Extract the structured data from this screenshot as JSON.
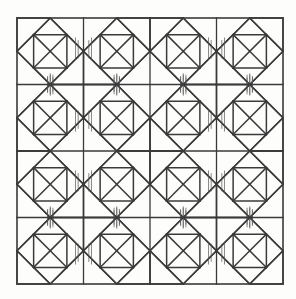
{
  "figure": {
    "name": "quilt-block-pattern",
    "canvas": {
      "width": 296,
      "height": 299
    },
    "background_color": "#fdfdfc"
  },
  "style": {
    "line_color": "#3a3a3a",
    "border_color": "#3a3a3a",
    "hairline_color": "#555555",
    "border_width": 1.6,
    "grid_width": 1.3,
    "block_width": 1.5,
    "hairline_width": 0.7,
    "fill": "none"
  },
  "grid": {
    "origin_x": 17,
    "origin_y": 18,
    "cell_size": 66.5,
    "columns": 4,
    "rows": 4,
    "total_width": 266,
    "total_height": 266,
    "column_line_x": [
      17,
      83.5,
      150,
      216.5,
      283
    ],
    "row_line_y": [
      18,
      84.5,
      151,
      217.5,
      284
    ]
  },
  "block": {
    "name": "diamond-card-trick",
    "description": "Square cell with inscribed diamond (square rotated 45 degrees) whose vertices touch the cell edge midpoints, plus internal diagonals subdividing the diamond into triangles and a small notched square.",
    "unit": 1.0,
    "diamond_vertices": [
      [
        0.5,
        0.0
      ],
      [
        1.0,
        0.5
      ],
      [
        0.5,
        1.0
      ],
      [
        0.0,
        0.5
      ]
    ],
    "internal_segments": [
      [
        0.0,
        0.5,
        0.5,
        0.0
      ],
      [
        0.5,
        0.0,
        1.0,
        0.5
      ],
      [
        1.0,
        0.5,
        0.5,
        1.0
      ],
      [
        0.5,
        1.0,
        0.0,
        0.5
      ],
      [
        0.25,
        0.25,
        0.75,
        0.75
      ],
      [
        0.5,
        0.0,
        0.25,
        0.25
      ],
      [
        0.25,
        0.25,
        0.0,
        0.5
      ],
      [
        0.75,
        0.75,
        1.0,
        0.5
      ],
      [
        0.75,
        0.75,
        0.5,
        1.0
      ],
      [
        0.25,
        0.25,
        0.75,
        0.25
      ],
      [
        0.75,
        0.25,
        0.75,
        0.75
      ],
      [
        0.25,
        0.25,
        0.25,
        0.75
      ],
      [
        0.25,
        0.75,
        0.75,
        0.75
      ],
      [
        0.5,
        0.0,
        0.75,
        0.25
      ],
      [
        0.25,
        0.75,
        0.5,
        1.0
      ],
      [
        0.0,
        0.5,
        0.25,
        0.75
      ],
      [
        0.75,
        0.25,
        1.0,
        0.5
      ],
      [
        0.5,
        0.5,
        0.75,
        0.25
      ],
      [
        0.5,
        0.5,
        0.25,
        0.75
      ]
    ],
    "corner_segments": [
      [
        0.0,
        0.0,
        0.0,
        0.5
      ],
      [
        0.0,
        0.0,
        0.5,
        0.0
      ],
      [
        1.0,
        1.0,
        1.0,
        0.5
      ],
      [
        1.0,
        1.0,
        0.5,
        1.0
      ]
    ],
    "hairlines": [
      [
        0.88,
        0.3,
        0.88,
        0.62
      ],
      [
        0.92,
        0.34,
        0.92,
        0.6
      ],
      [
        0.5,
        0.86,
        0.5,
        1.16
      ],
      [
        0.54,
        0.9,
        0.54,
        1.14
      ],
      [
        0.46,
        0.9,
        0.46,
        1.12
      ]
    ]
  },
  "tiling": {
    "description": "Blocks alternate mirrored horizontally by column parity and vertically by row parity, producing large secondary diamonds across block boundaries.",
    "cells": [
      {
        "row": 0,
        "col": 0,
        "flip_x": false,
        "flip_y": false
      },
      {
        "row": 0,
        "col": 1,
        "flip_x": true,
        "flip_y": false
      },
      {
        "row": 0,
        "col": 2,
        "flip_x": false,
        "flip_y": false
      },
      {
        "row": 0,
        "col": 3,
        "flip_x": true,
        "flip_y": false
      },
      {
        "row": 1,
        "col": 0,
        "flip_x": false,
        "flip_y": true
      },
      {
        "row": 1,
        "col": 1,
        "flip_x": true,
        "flip_y": true
      },
      {
        "row": 1,
        "col": 2,
        "flip_x": false,
        "flip_y": true
      },
      {
        "row": 1,
        "col": 3,
        "flip_x": true,
        "flip_y": true
      },
      {
        "row": 2,
        "col": 0,
        "flip_x": false,
        "flip_y": false
      },
      {
        "row": 2,
        "col": 1,
        "flip_x": true,
        "flip_y": false
      },
      {
        "row": 2,
        "col": 2,
        "flip_x": false,
        "flip_y": false
      },
      {
        "row": 2,
        "col": 3,
        "flip_x": true,
        "flip_y": false
      },
      {
        "row": 3,
        "col": 0,
        "flip_x": false,
        "flip_y": true
      },
      {
        "row": 3,
        "col": 1,
        "flip_x": true,
        "flip_y": true
      },
      {
        "row": 3,
        "col": 2,
        "flip_x": false,
        "flip_y": true
      },
      {
        "row": 3,
        "col": 3,
        "flip_x": true,
        "flip_y": true
      }
    ]
  }
}
